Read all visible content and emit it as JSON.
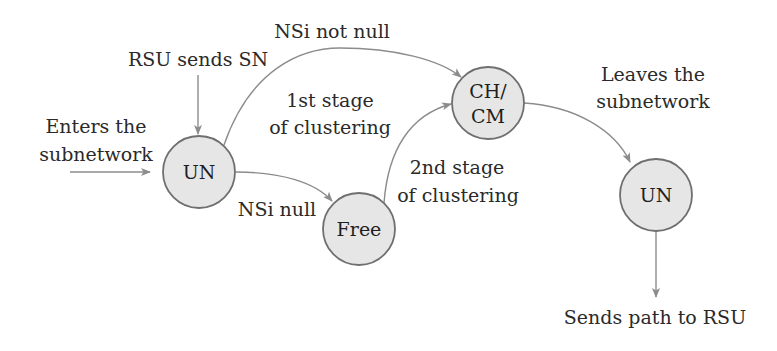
{
  "diagram": {
    "type": "state-transition",
    "nodes": [
      {
        "id": "un-start",
        "label": "UN",
        "cx": 199,
        "cy": 172
      },
      {
        "id": "free",
        "label": "Free",
        "cx": 359,
        "cy": 229
      },
      {
        "id": "ch-cm",
        "label_line1": "CH/",
        "label_line2": "CM",
        "cx": 488,
        "cy": 103
      },
      {
        "id": "un-end",
        "label": "UN",
        "cx": 656,
        "cy": 195
      }
    ],
    "labels": {
      "rsu_sends_sn": "RSU sends SN",
      "enters_line1": "Enters the",
      "enters_line2": "subnetwork",
      "nsi_not_null": "NSi not null",
      "stage1_line1": "1st stage",
      "stage1_line2": "of clustering",
      "nsi_null": "NSi null",
      "stage2_line1": "2nd stage",
      "stage2_line2": "of clustering",
      "leaves_line1": "Leaves the",
      "leaves_line2": "subnetwork",
      "sends_path": "Sends path to RSU"
    },
    "edges": [
      {
        "from": "external",
        "to": "un-start",
        "label": "Enters the subnetwork"
      },
      {
        "from": "external",
        "to": "un-start",
        "label": "RSU sends SN"
      },
      {
        "from": "un-start",
        "to": "ch-cm",
        "label": "NSi not null"
      },
      {
        "from": "un-start",
        "to": "free",
        "label": "NSi null"
      },
      {
        "from": "free",
        "to": "ch-cm",
        "label": "2nd stage of clustering"
      },
      {
        "from": "ch-cm",
        "to": "un-end",
        "label": "Leaves the subnetwork"
      },
      {
        "from": "un-end",
        "to": "external",
        "label": "Sends path to RSU"
      }
    ],
    "colors": {
      "node_fill": "#e6e6e6",
      "node_stroke": "#6f6f6f",
      "edge": "#8c8c8c",
      "text": "#2a2a2a"
    }
  }
}
